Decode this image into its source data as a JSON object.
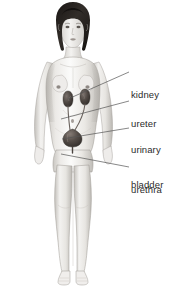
{
  "figure": {
    "background_color": "#ffffff",
    "text_color": "#2b2b2b",
    "leader_line_color": "#555555",
    "skin_light": "#f2f1ef",
    "skin_mid": "#d8d6d2",
    "skin_shadow": "#b3b0ab",
    "hair_color": "#2a2623",
    "organ_color": "#4d4642",
    "organ_highlight": "#6d6460"
  },
  "labels": [
    {
      "id": "kidney",
      "name": "kidney",
      "lines": [
        "kidney"
      ],
      "text_x": 131,
      "text_y": 66,
      "leader": {
        "x1": 129,
        "y1": 72,
        "x2": 68,
        "y2": 99
      }
    },
    {
      "id": "ureter",
      "name": "ureter",
      "lines": [
        "ureter"
      ],
      "text_x": 131,
      "text_y": 95,
      "leader": {
        "x1": 129,
        "y1": 101,
        "x2": 61,
        "y2": 119
      }
    },
    {
      "id": "urinary-bladder",
      "name": "urinary bladder",
      "lines": [
        "urinary",
        "bladder"
      ],
      "text_x": 131,
      "text_y": 121,
      "leader": {
        "x1": 129,
        "y1": 128,
        "x2": 62,
        "y2": 139
      }
    },
    {
      "id": "urethra",
      "name": "urethra",
      "lines": [
        "urethra"
      ],
      "text_x": 131,
      "text_y": 161,
      "leader": {
        "x1": 129,
        "y1": 167,
        "x2": 61,
        "y2": 154
      }
    }
  ],
  "organs": [
    {
      "id": "kidney-left",
      "name": "kidney (figure's left)",
      "cx": 65,
      "cy": 99
    },
    {
      "id": "kidney-right",
      "name": "kidney (figure's right)",
      "cx": 83,
      "cy": 97
    },
    {
      "id": "ureter-left",
      "name": "ureter (figure's left)"
    },
    {
      "id": "ureter-right",
      "name": "ureter (figure's right)"
    },
    {
      "id": "bladder",
      "name": "urinary bladder",
      "cx": 71,
      "cy": 136
    },
    {
      "id": "urethra",
      "name": "urethra",
      "cx": 71,
      "cy": 148
    }
  ]
}
